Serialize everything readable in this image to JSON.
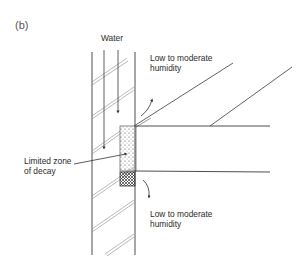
{
  "figure": {
    "panel_label": "(b)",
    "labels": {
      "water": "Water",
      "humidity_top": "Low to moderate\nhumidity",
      "humidity_bottom": "Low to moderate\nhumidity",
      "decay_zone": "Limited zone\nof decay"
    },
    "colors": {
      "line": "#3a3a3a",
      "hatch": "#9a9a9a",
      "background": "#ffffff"
    },
    "elements": [
      "vertical wall with diagonal hatching",
      "water flow arrows (downward)",
      "horizontal beam entering wall",
      "two inclined rafters",
      "dotted limited zone of decay at beam end",
      "cross-hatched bearing block below beam",
      "curved humidity arrows above and below beam"
    ]
  }
}
